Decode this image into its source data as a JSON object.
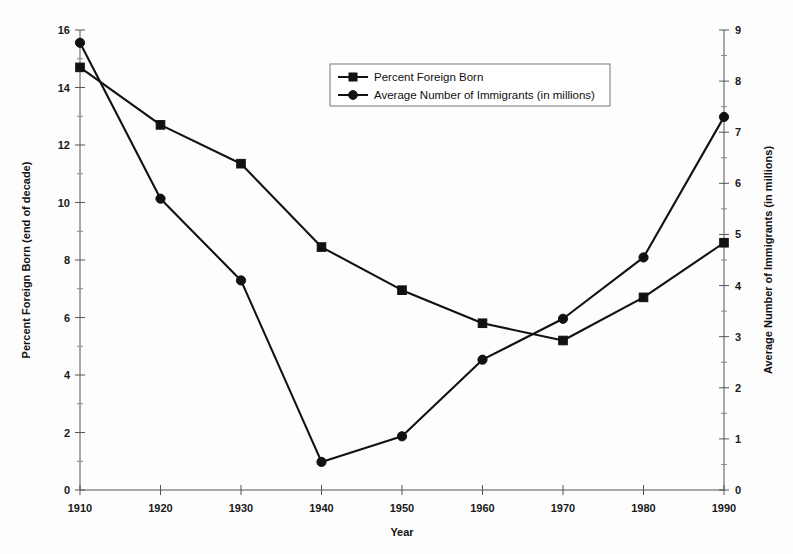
{
  "chart_data": {
    "type": "line",
    "title": "",
    "xlabel": "Year",
    "x": [
      1910,
      1920,
      1930,
      1940,
      1950,
      1960,
      1970,
      1980,
      1990
    ],
    "xticklabels": [
      "1910",
      "1920",
      "1930",
      "1940",
      "1950",
      "1960",
      "1970",
      "1980",
      "1990"
    ],
    "xlim": [
      1910,
      1990
    ],
    "grid": false,
    "legend_position": "top-center",
    "left_axis": {
      "label": "Percent Foreign Born (end of decade)",
      "ylim": [
        0,
        16
      ],
      "ticks": [
        0,
        2,
        4,
        6,
        8,
        10,
        12,
        14,
        16
      ],
      "ticklabels": [
        "0",
        "2",
        "4",
        "6",
        "8",
        "10",
        "12",
        "14",
        "16"
      ]
    },
    "right_axis": {
      "label": "Average Number of Immigrants (in millions)",
      "ylim": [
        0,
        9
      ],
      "ticks": [
        0,
        1,
        2,
        3,
        4,
        5,
        6,
        7,
        8,
        9
      ],
      "ticklabels": [
        "0",
        "1",
        "2",
        "3",
        "4",
        "5",
        "6",
        "7",
        "8",
        "9"
      ]
    },
    "series": [
      {
        "name": "Percent Foreign Born",
        "axis": "left",
        "marker": "square",
        "values": [
          14.7,
          12.7,
          11.35,
          8.45,
          6.95,
          5.8,
          5.2,
          6.7,
          8.6
        ]
      },
      {
        "name": "Average Number of Immigrants (in millions)",
        "axis": "right",
        "marker": "circle",
        "values": [
          8.75,
          5.7,
          4.1,
          0.55,
          1.05,
          2.55,
          3.35,
          4.55,
          7.3
        ]
      }
    ],
    "colors": {
      "series_stroke": "#111111",
      "axis": "#555555",
      "background": "#fdfdfd"
    }
  }
}
